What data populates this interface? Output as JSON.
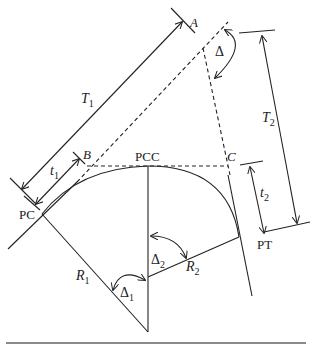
{
  "diagram": {
    "points": {
      "A": "A",
      "B": "B",
      "C": "C",
      "PC": "PC",
      "PCC": "PCC",
      "PT": "PT"
    },
    "dimensions": {
      "T1": {
        "base": "T",
        "sub": "1"
      },
      "T2": {
        "base": "T",
        "sub": "2"
      },
      "t1": {
        "base": "t",
        "sub": "1"
      },
      "t2": {
        "base": "t",
        "sub": "2"
      },
      "R1": {
        "base": "R",
        "sub": "1"
      },
      "R2": {
        "base": "R",
        "sub": "2"
      }
    },
    "angles": {
      "delta": "Δ",
      "delta1": {
        "base": "Δ",
        "sub": "1"
      },
      "delta2": {
        "base": "Δ",
        "sub": "2"
      }
    },
    "colors": {
      "line": "#222222",
      "rule": "#8a8a8a"
    }
  }
}
